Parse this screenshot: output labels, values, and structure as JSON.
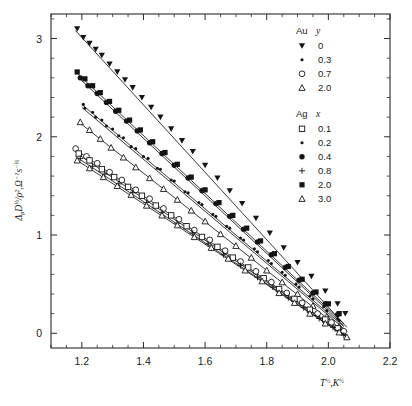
{
  "figure": {
    "kind": "scatter-plot",
    "background": "#ffffff",
    "ink_color": "#141414"
  },
  "chart_data": {
    "type": "scatter",
    "title": "",
    "xlabel": "T½,K½",
    "ylabel": "ΔρD½/ρ²,Ω⁻¹s⁻½",
    "xlim": [
      1.1,
      2.2
    ],
    "ylim": [
      -0.15,
      3.25
    ],
    "xticks": [
      1.2,
      1.4,
      1.6,
      1.8,
      2.0,
      2.2
    ],
    "xticklabels": [
      "1.2",
      "1.4",
      "1.6",
      "1.8",
      "2.0",
      "2.2"
    ],
    "yticks": [
      0,
      1,
      2,
      3
    ],
    "yticklabels": [
      "0",
      "1",
      "2",
      "3"
    ],
    "x_minor_step": 0.05,
    "y_minor_step": 0.2,
    "grid": false,
    "legend_position": "top-right",
    "legend_groups": [
      {
        "header_element": "Au",
        "header_variable": "y",
        "entries": [
          {
            "label": "0",
            "marker": "triangle-down-filled"
          },
          {
            "label": "0.3",
            "marker": "dot-small-filled"
          },
          {
            "label": "0.7",
            "marker": "circle-open"
          },
          {
            "label": "2.0",
            "marker": "triangle-up-open"
          }
        ]
      },
      {
        "header_element": "Ag",
        "header_variable": "x",
        "entries": [
          {
            "label": "0.1",
            "marker": "square-open"
          },
          {
            "label": "0.2",
            "marker": "dot-small-filled"
          },
          {
            "label": "0.4",
            "marker": "circle-filled"
          },
          {
            "label": "0.8",
            "marker": "plus"
          },
          {
            "label": "2.0",
            "marker": "square-filled"
          },
          {
            "label": "3.0",
            "marker": "triangle-up-open"
          }
        ]
      }
    ],
    "series": [
      {
        "name": "Au y = 0",
        "marker": "triangle-down-filled",
        "fit": {
          "x0": 1.18,
          "y0": 3.08,
          "x1": 2.06,
          "y1": 0.06
        },
        "x": [
          1.185,
          1.205,
          1.225,
          1.245,
          1.265,
          1.29,
          1.315,
          1.34,
          1.365,
          1.395,
          1.425,
          1.455,
          1.49,
          1.525,
          1.56,
          1.6,
          1.64,
          1.68,
          1.72,
          1.765,
          1.81,
          1.855,
          1.9,
          1.945,
          1.99,
          2.03,
          2.055
        ],
        "y": [
          3.1,
          3.01,
          2.95,
          2.89,
          2.83,
          2.74,
          2.66,
          2.58,
          2.5,
          2.4,
          2.3,
          2.2,
          2.08,
          1.96,
          1.85,
          1.71,
          1.58,
          1.45,
          1.32,
          1.17,
          1.02,
          0.87,
          0.72,
          0.58,
          0.43,
          0.3,
          0.2
        ]
      },
      {
        "name": "Ag x = 2.0",
        "marker": "square-filled",
        "fit": {
          "x0": 1.18,
          "y0": 2.66,
          "x1": 2.05,
          "y1": 0.1
        },
        "x": [
          1.185,
          1.21,
          1.235,
          1.26,
          1.29,
          1.32,
          1.355,
          1.39,
          1.43,
          1.47,
          1.51,
          1.555,
          1.6,
          1.645,
          1.69,
          1.735,
          1.78,
          1.825,
          1.87,
          1.915,
          1.96,
          2.0,
          2.035
        ],
        "y": [
          2.66,
          2.59,
          2.52,
          2.45,
          2.36,
          2.27,
          2.17,
          2.07,
          1.95,
          1.84,
          1.72,
          1.59,
          1.46,
          1.33,
          1.2,
          1.07,
          0.94,
          0.81,
          0.68,
          0.55,
          0.42,
          0.3,
          0.2
        ]
      },
      {
        "name": "Ag x = 0.4",
        "marker": "circle-filled",
        "fit": {
          "x0": 1.19,
          "y0": 2.6,
          "x1": 2.05,
          "y1": 0.08
        },
        "x": [
          1.195,
          1.22,
          1.25,
          1.28,
          1.31,
          1.345,
          1.38,
          1.42,
          1.46,
          1.5,
          1.545,
          1.59,
          1.635,
          1.68,
          1.725,
          1.77,
          1.815,
          1.86,
          1.905,
          1.95,
          1.99,
          2.03
        ],
        "y": [
          2.6,
          2.52,
          2.44,
          2.35,
          2.26,
          2.16,
          2.06,
          1.94,
          1.83,
          1.71,
          1.58,
          1.45,
          1.32,
          1.19,
          1.06,
          0.93,
          0.8,
          0.67,
          0.54,
          0.41,
          0.3,
          0.19
        ]
      },
      {
        "name": "Ag x = 0.2",
        "marker": "dot-small-filled",
        "fit": {
          "x0": 1.2,
          "y0": 2.33,
          "x1": 2.05,
          "y1": 0.07
        },
        "x": [
          1.205,
          1.235,
          1.265,
          1.3,
          1.335,
          1.375,
          1.415,
          1.455,
          1.5,
          1.545,
          1.59,
          1.635,
          1.68,
          1.725,
          1.77,
          1.815,
          1.86,
          1.905,
          1.95,
          1.995,
          2.035
        ],
        "y": [
          2.33,
          2.25,
          2.17,
          2.08,
          1.99,
          1.88,
          1.78,
          1.67,
          1.55,
          1.43,
          1.31,
          1.19,
          1.07,
          0.95,
          0.83,
          0.71,
          0.59,
          0.47,
          0.35,
          0.23,
          0.13
        ]
      },
      {
        "name": "Au y = 0.3",
        "marker": "dot-small-filled",
        "fit": {
          "x0": 1.2,
          "y0": 2.3,
          "x1": 2.05,
          "y1": 0.05
        },
        "x": [
          1.21,
          1.245,
          1.28,
          1.32,
          1.36,
          1.4,
          1.445,
          1.49,
          1.535,
          1.58,
          1.625,
          1.67,
          1.715,
          1.76,
          1.805,
          1.85,
          1.895,
          1.94,
          1.985,
          2.03
        ],
        "y": [
          2.29,
          2.2,
          2.11,
          2.01,
          1.9,
          1.8,
          1.68,
          1.56,
          1.44,
          1.33,
          1.21,
          1.09,
          0.97,
          0.86,
          0.74,
          0.62,
          0.5,
          0.38,
          0.27,
          0.15
        ]
      },
      {
        "name": "Ag x = 3.0",
        "marker": "triangle-up-open",
        "fit": {
          "x0": 1.19,
          "y0": 2.15,
          "x1": 2.05,
          "y1": 0.02
        },
        "x": [
          1.195,
          1.225,
          1.26,
          1.295,
          1.335,
          1.375,
          1.42,
          1.465,
          1.51,
          1.555,
          1.6,
          1.65,
          1.7,
          1.75,
          1.8,
          1.85,
          1.9,
          1.95,
          1.995,
          2.035
        ],
        "y": [
          2.15,
          2.07,
          1.98,
          1.89,
          1.79,
          1.69,
          1.58,
          1.47,
          1.36,
          1.25,
          1.14,
          1.01,
          0.89,
          0.77,
          0.64,
          0.52,
          0.4,
          0.28,
          0.17,
          0.07
        ]
      },
      {
        "name": "Au y = 0.7",
        "marker": "circle-open",
        "fit": {
          "x0": 1.175,
          "y0": 1.88,
          "x1": 2.06,
          "y1": -0.02
        },
        "x": [
          1.18,
          1.215,
          1.25,
          1.29,
          1.33,
          1.375,
          1.42,
          1.465,
          1.515,
          1.565,
          1.615,
          1.665,
          1.715,
          1.765,
          1.815,
          1.865,
          1.915,
          1.965,
          2.01,
          2.05
        ],
        "y": [
          1.88,
          1.8,
          1.73,
          1.64,
          1.56,
          1.46,
          1.37,
          1.27,
          1.16,
          1.05,
          0.95,
          0.84,
          0.73,
          0.63,
          0.52,
          0.41,
          0.31,
          0.2,
          0.11,
          0.02
        ]
      },
      {
        "name": "Ag x = 0.1",
        "marker": "square-open",
        "fit": {
          "x0": 1.18,
          "y0": 1.84,
          "x1": 2.06,
          "y1": -0.03
        },
        "x": [
          1.19,
          1.225,
          1.265,
          1.305,
          1.35,
          1.395,
          1.44,
          1.49,
          1.54,
          1.59,
          1.64,
          1.69,
          1.74,
          1.79,
          1.84,
          1.89,
          1.94,
          1.99,
          2.03
        ],
        "y": [
          1.83,
          1.76,
          1.67,
          1.59,
          1.49,
          1.4,
          1.3,
          1.2,
          1.09,
          0.98,
          0.88,
          0.77,
          0.67,
          0.56,
          0.45,
          0.35,
          0.24,
          0.14,
          0.05
        ]
      },
      {
        "name": "Ag x = 0.8",
        "marker": "plus",
        "fit": {
          "x0": 1.18,
          "y0": 1.8,
          "x1": 2.06,
          "y1": -0.04
        },
        "x": [
          1.195,
          1.235,
          1.275,
          1.32,
          1.365,
          1.41,
          1.46,
          1.51,
          1.56,
          1.61,
          1.66,
          1.715,
          1.77,
          1.82,
          1.87,
          1.92,
          1.97,
          2.015,
          2.05
        ],
        "y": [
          1.78,
          1.7,
          1.62,
          1.52,
          1.43,
          1.33,
          1.23,
          1.12,
          1.02,
          0.91,
          0.8,
          0.69,
          0.57,
          0.47,
          0.36,
          0.26,
          0.15,
          0.06,
          -0.02
        ]
      },
      {
        "name": "Au y = 2.0",
        "marker": "triangle-up-open",
        "fit": {
          "x0": 1.18,
          "y0": 1.77,
          "x1": 2.07,
          "y1": -0.06
        },
        "x": [
          1.185,
          1.225,
          1.27,
          1.315,
          1.36,
          1.41,
          1.46,
          1.51,
          1.565,
          1.62,
          1.675,
          1.73,
          1.785,
          1.84,
          1.89,
          1.94,
          1.99,
          2.035,
          2.06
        ],
        "y": [
          1.76,
          1.68,
          1.59,
          1.5,
          1.41,
          1.3,
          1.2,
          1.1,
          0.98,
          0.87,
          0.76,
          0.64,
          0.53,
          0.41,
          0.31,
          0.2,
          0.1,
          0.01,
          -0.04
        ]
      }
    ]
  }
}
